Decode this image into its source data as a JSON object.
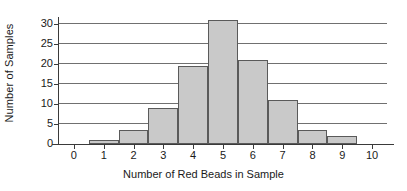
{
  "chart_data": {
    "type": "bar",
    "title": "",
    "subtitle": "",
    "xlabel": "Number of Red Beads in Sample",
    "ylabel": "Number of Samples",
    "categories": [
      "0",
      "1",
      "2",
      "3",
      "4",
      "5",
      "6",
      "7",
      "8",
      "9",
      "10"
    ],
    "x": [
      0,
      1,
      2,
      3,
      4,
      5,
      6,
      7,
      8,
      9,
      10
    ],
    "values": [
      0,
      1,
      3.5,
      9,
      19.5,
      31,
      21,
      11,
      3.5,
      2,
      0
    ],
    "xlim": [
      -0.5,
      10.5
    ],
    "ylim": [
      0,
      31.5
    ],
    "xticks": [
      0,
      1,
      2,
      3,
      4,
      5,
      6,
      7,
      8,
      9,
      10
    ],
    "xtick_labels": [
      "0",
      "1",
      "2",
      "3",
      "4",
      "5",
      "6",
      "7",
      "8",
      "9",
      "10"
    ],
    "yticks": [
      0,
      5,
      10,
      15,
      20,
      25,
      30
    ],
    "ytick_labels": [
      "0",
      "5",
      "10",
      "15",
      "20",
      "25",
      "30"
    ],
    "grid": "horizontal",
    "legend": "none",
    "bar_width": 1,
    "bar_fill_color": "#c9c9c9",
    "bar_edge_color": "#5a5a5a",
    "gridline_color": "#707070",
    "axis_color": "#3a3a3a",
    "background_color": "#ffffff"
  }
}
